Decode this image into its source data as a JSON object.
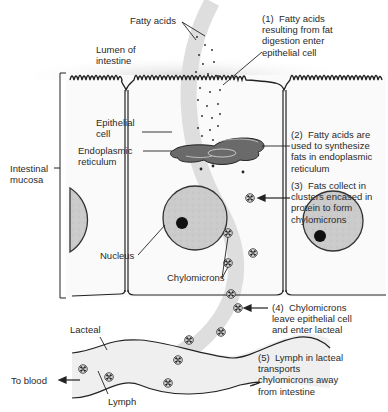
{
  "labels": {
    "fatty_acids": "Fatty acids",
    "lumen": "Lumen of\nintestine",
    "epithelial_cell": "Epithelial\ncell",
    "endoplasmic_reticulum": "Endoplasmic\nreticulum",
    "intestinal_mucosa": "Intestinal\nmucosa",
    "nucleus": "Nucleus",
    "chylomicrons": "Chylomicrons",
    "lacteal": "Lacteal",
    "to_blood": "To blood",
    "lymph": "Lymph"
  },
  "steps": [
    {
      "num": "(1)",
      "text": "(1)  Fatty acids\nresulting from fat\ndigestion enter\nepithelial cell"
    },
    {
      "num": "(2)",
      "text": "(2)  Fatty acids are\nused to synthesize\nfats in endoplasmic\nreticulum"
    },
    {
      "num": "(3)",
      "text": "(3)  Fats collect in\nclusters encased in\nprotein to form\nchylomicrons"
    },
    {
      "num": "(4)",
      "text": "(4)  Chylomicrons\nleave epithelial cell\nand enter lacteal"
    },
    {
      "num": "(5)",
      "text": "(5)  Lymph in lacteal\ntransports\nchylomicrons away\nfrom intestine"
    }
  ],
  "colors": {
    "outline": "#222222",
    "nucleus_fill": "#c9c9c9",
    "er_fill": "#6e6e6e",
    "flow_arrow": "#dcdcdc",
    "lacteal_fill": "#ececec"
  }
}
